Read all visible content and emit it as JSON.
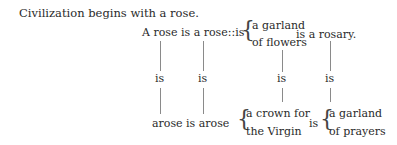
{
  "poem": {
    "title_line": "Civilization begins with a rose.",
    "line2": "A rose is a rose::is",
    "brace1": {
      "top": "a garland",
      "bottom": "of flowers"
    },
    "line2_end": "is a rosary.",
    "middle_is": [
      "is",
      "is",
      "is",
      "is"
    ],
    "bottom_line": "arose is arose",
    "brace2": {
      "top": "a crown for",
      "bottom": "the Virgin"
    },
    "bottom_is": "is",
    "brace3": {
      "top": "a garland",
      "bottom": "of prayers"
    }
  }
}
